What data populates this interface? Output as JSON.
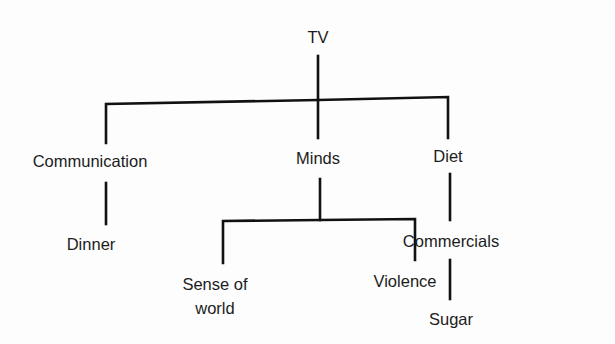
{
  "diagram": {
    "type": "tree",
    "root": {
      "label": "TV",
      "children": [
        {
          "label": "Communication",
          "children": [
            {
              "label": "Dinner"
            }
          ]
        },
        {
          "label": "Minds",
          "children": [
            {
              "label": "Sense of world"
            },
            {
              "label": "Violence"
            }
          ]
        },
        {
          "label": "Diet",
          "children": [
            {
              "label": "Commercials",
              "children": [
                {
                  "label": "Sugar"
                }
              ]
            }
          ]
        }
      ]
    },
    "nodes": {
      "tv": "TV",
      "communication": "Communication",
      "minds": "Minds",
      "diet": "Diet",
      "dinner": "Dinner",
      "sense_of_world_line1": "Sense of",
      "sense_of_world_line2": "world",
      "violence": "Violence",
      "commercials": "Commercials",
      "sugar": "Sugar"
    },
    "line_color": "#111111",
    "text_color": "#1c1c1c"
  }
}
